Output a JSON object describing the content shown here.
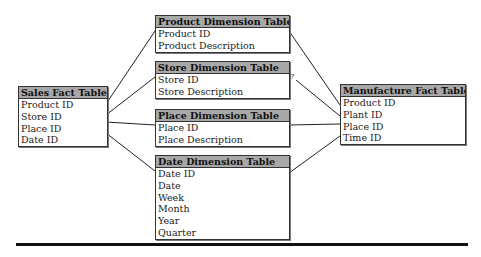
{
  "tables": {
    "sales": {
      "title": "Sales Fact Table",
      "fields": [
        "Product ID",
        "Store ID",
        "Place ID",
        "Date ID"
      ]
    },
    "product": {
      "title": "Product Dimension Table",
      "fields": [
        "Product ID",
        "Product Description"
      ]
    },
    "store": {
      "title": "Store Dimension Table",
      "fields": [
        "Store ID",
        "Store Description"
      ]
    },
    "place": {
      "title": "Place Dimension Table",
      "fields": [
        "Place ID",
        "Place Description"
      ]
    },
    "date": {
      "title": "Date Dimension Table",
      "fields": [
        "Date ID",
        "Date",
        "Week",
        "Month",
        "Year",
        "Quarter"
      ]
    },
    "manufacture": {
      "title": "Manufacture Fact Table",
      "fields": [
        "Product ID",
        "Plant ID",
        "Place ID",
        "Time ID"
      ]
    }
  },
  "annotations": {
    "unknown_link": "?"
  },
  "colors": {
    "header_bg": "#a8a8a8",
    "border": "#333333",
    "line": "#222222"
  }
}
